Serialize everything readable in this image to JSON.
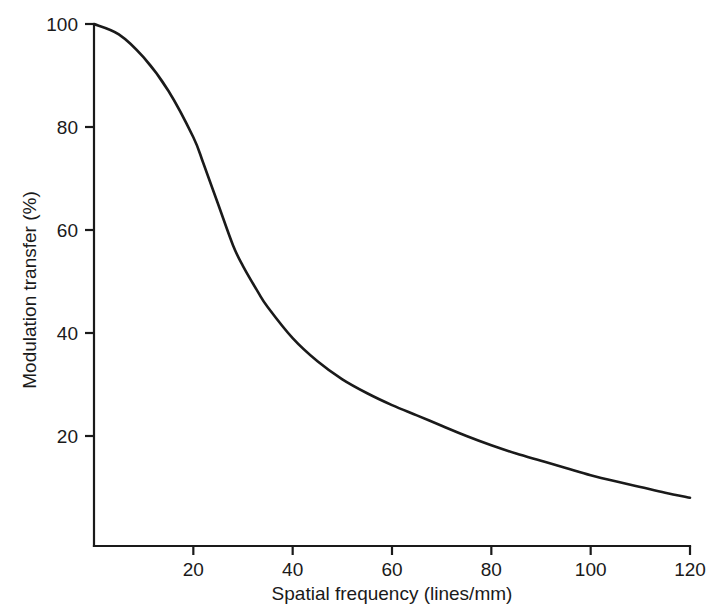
{
  "figure": {
    "background_color": "#ffffff",
    "line_color": "#1a1a1a",
    "text_color": "#1a1a1a"
  },
  "chart_data": {
    "type": "line",
    "title": "",
    "subtitle": "",
    "xlabel": "Spatial frequency (lines/mm)",
    "ylabel": "Modulation transfer (%)",
    "xlim": [
      0,
      120
    ],
    "ylim": [
      0,
      100
    ],
    "xticks": [
      20,
      40,
      60,
      80,
      100,
      120
    ],
    "xtick_labels": [
      "20",
      "40",
      "60",
      "80",
      "100",
      "120"
    ],
    "yticks": [
      20,
      40,
      60,
      80,
      100
    ],
    "ytick_labels": [
      "20",
      "40",
      "60",
      "80",
      "100"
    ],
    "grid": false,
    "legend": null,
    "legend_position": "none",
    "annotations": [],
    "series": [
      {
        "name": "Modulation transfer function",
        "color": "#1a1a1a",
        "x": [
          0,
          5,
          10,
          15,
          20,
          22,
          25,
          28,
          30,
          33,
          35,
          40,
          45,
          50,
          55,
          60,
          65,
          70,
          75,
          80,
          85,
          90,
          95,
          100,
          105,
          110,
          115,
          120
        ],
        "y": [
          100,
          98,
          93.5,
          87,
          78,
          73,
          65,
          57,
          53,
          48,
          45,
          39,
          34.5,
          31,
          28.3,
          26,
          24,
          22,
          20,
          18.2,
          16.6,
          15.2,
          13.8,
          12.4,
          11.2,
          10.1,
          9,
          8
        ]
      }
    ]
  },
  "axes": {
    "x_axis_name": "spatial-frequency-axis",
    "y_axis_name": "modulation-transfer-axis"
  }
}
